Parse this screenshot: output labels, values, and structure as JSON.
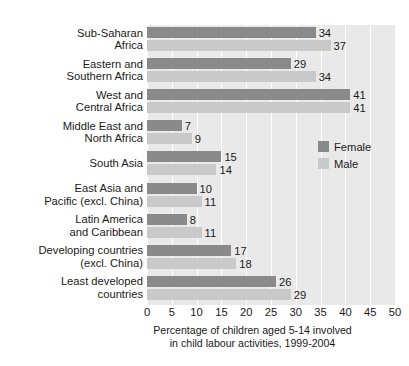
{
  "figure": {
    "title_sliver": "",
    "background_color": "#ffffff",
    "plot_background_color": "#e9e9e9",
    "gridline_color": "#ffffff"
  },
  "legend": {
    "position": "inside-right",
    "entries": [
      {
        "label": "Female",
        "color": "#8a8a8a"
      },
      {
        "label": "Male",
        "color": "#c9c9c9"
      }
    ]
  },
  "axis": {
    "caption_line1": "Percentage of children aged 5-14 involved",
    "caption_line2": "in child labour activities, 1999-2004",
    "ticks": [
      "0",
      "5",
      "10",
      "15",
      "20",
      "25",
      "30",
      "35",
      "40",
      "45",
      "50"
    ]
  },
  "chart_data": {
    "type": "bar",
    "orientation": "horizontal",
    "title": "",
    "xlabel": "Percentage of children aged 5-14 involved in child labour activities, 1999-2004",
    "ylabel": "",
    "xlim": [
      0,
      50
    ],
    "xticks": [
      0,
      5,
      10,
      15,
      20,
      25,
      30,
      35,
      40,
      45,
      50
    ],
    "grid": true,
    "legend_position": "inside-right",
    "categories": [
      "Sub-Saharan\nAfrica",
      "Eastern and\nSouthern Africa",
      "West and\nCentral Africa",
      "Middle East and\nNorth Africa",
      "South Asia",
      "East Asia and\nPacific (excl. China)",
      "Latin America\nand Caribbean",
      "Developing countries\n(excl. China)",
      "Least developed\ncountries"
    ],
    "series": [
      {
        "name": "Female",
        "color": "#8a8a8a",
        "values": [
          34,
          29,
          41,
          7,
          15,
          10,
          8,
          17,
          26
        ]
      },
      {
        "name": "Male",
        "color": "#c9c9c9",
        "values": [
          37,
          34,
          41,
          9,
          14,
          11,
          11,
          18,
          29
        ]
      }
    ]
  }
}
